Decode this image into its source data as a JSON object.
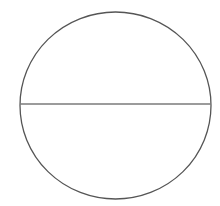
{
  "diagram": {
    "background": "#ffffff",
    "circle": {
      "cx": 115.5,
      "cy": 105.5,
      "rx": 95.5,
      "ry": 93.5,
      "stroke": "#555555",
      "stroke_width": 1.3,
      "fill": "none"
    },
    "diameter": {
      "x1": 20,
      "y1": 104,
      "x2": 211,
      "y2": 104,
      "stroke": "#7a7a7a",
      "stroke_width": 1.6
    }
  }
}
